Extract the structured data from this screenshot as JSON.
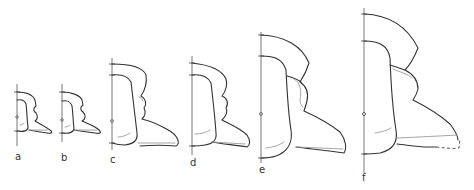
{
  "figure": {
    "panels": [
      {
        "id": "a",
        "label": "a"
      },
      {
        "id": "b",
        "label": "b"
      },
      {
        "id": "c",
        "label": "c"
      },
      {
        "id": "d",
        "label": "d"
      },
      {
        "id": "e",
        "label": "e"
      },
      {
        "id": "f",
        "label": "f"
      }
    ],
    "colors": {
      "outline": "#333333",
      "inner_line": "#9a9a9a",
      "axis": "#555555",
      "background": "#ffffff"
    }
  }
}
